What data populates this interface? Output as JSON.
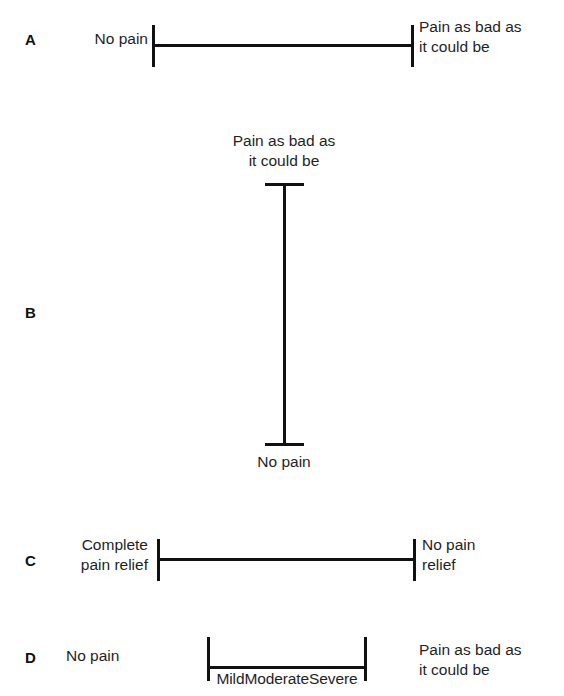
{
  "figure": {
    "type": "pain-assessment-scales-diagram",
    "ink_color": "#111111",
    "text_color": "#1f1f1f",
    "background_color": "#ffffff"
  },
  "panels": {
    "a": {
      "letter": "A",
      "orientation": "horizontal",
      "left_label": "No pain",
      "right_label": "Pain as bad as\nit could be"
    },
    "b": {
      "letter": "B",
      "orientation": "vertical",
      "top_label": "Pain as bad as\nit could be",
      "bottom_label": "No pain"
    },
    "c": {
      "letter": "C",
      "orientation": "horizontal",
      "left_label": "Complete\npain relief",
      "right_label": "No pain\nrelief"
    },
    "d": {
      "letter": "D",
      "orientation": "horizontal",
      "left_label": "No pain",
      "right_label": "Pain as bad as\nit could be",
      "scale_words": "MildModerateSevere",
      "scale_word_list": [
        "Mild",
        "Moderate",
        "Severe"
      ]
    }
  }
}
